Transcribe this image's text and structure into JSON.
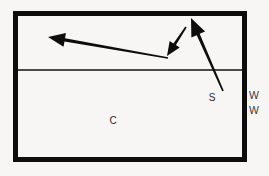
{
  "figure": {
    "name": "cross-section-arrow-diagram",
    "background_color": "#f7f6f4",
    "ink_color": "#0d0d0d",
    "box": {
      "x": 13,
      "y": 11,
      "width": 234,
      "height": 151,
      "border_width": 5
    },
    "divider": {
      "y": 70,
      "thickness": 1.6
    },
    "labels": {
      "interface_label": "S",
      "lower_region_label": "C",
      "side_label_top": "W",
      "side_label_bottom": "W"
    },
    "arrows": [
      {
        "id": "long-left-arrow",
        "label": "",
        "x1": 168,
        "y1": 58,
        "x2": 48,
        "y2": 37,
        "head": "start-to-end",
        "shaft_width": 3.2,
        "head_length": 17,
        "head_half_width": 7
      },
      {
        "id": "short-down-left-arrow",
        "label": "",
        "x1": 186,
        "y1": 27,
        "x2": 167,
        "y2": 56,
        "head": "start-to-end",
        "shaft_width": 3.0,
        "head_length": 14,
        "head_half_width": 6
      },
      {
        "id": "s-up-left-arrow",
        "label": "S",
        "x1": 223,
        "y1": 91,
        "x2": 191,
        "y2": 18,
        "head": "start-to-end",
        "shaft_width": 3.2,
        "head_length": 18,
        "head_half_width": 7.5
      }
    ],
    "label_positions": {
      "S": {
        "x": 212,
        "y": 101
      },
      "C": {
        "x": 113,
        "y": 124
      },
      "W_top": {
        "x": 254,
        "y": 99
      },
      "W_bottom": {
        "x": 254,
        "y": 114
      }
    }
  }
}
